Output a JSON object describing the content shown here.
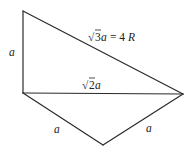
{
  "diagram": {
    "type": "geometry",
    "vertices": {
      "top": [
        23,
        11
      ],
      "left": [
        23,
        93
      ],
      "right": [
        183,
        94
      ],
      "bottom": [
        103,
        145
      ]
    },
    "edges": [
      {
        "from": "top",
        "to": "left",
        "label": "a"
      },
      {
        "from": "top",
        "to": "right",
        "label": "√3a = 4R"
      },
      {
        "from": "left",
        "to": "right",
        "label": "√2a"
      },
      {
        "from": "left",
        "to": "bottom",
        "label": "a"
      },
      {
        "from": "bottom",
        "to": "right",
        "label": "a"
      }
    ],
    "labels": {
      "left_edge": "a",
      "hypotenuse_sqrt": "√",
      "hypotenuse_radicand": "3",
      "hypotenuse_var": "a",
      "hypotenuse_eq": " = 4",
      "hypotenuse_R": "R",
      "diagonal_sqrt": "√",
      "diagonal_radicand": "2",
      "diagonal_var": "a",
      "bottom_left_edge": "a",
      "bottom_right_edge": "a"
    },
    "stroke_color": "#2a2a2a",
    "background": "#ffffff"
  }
}
